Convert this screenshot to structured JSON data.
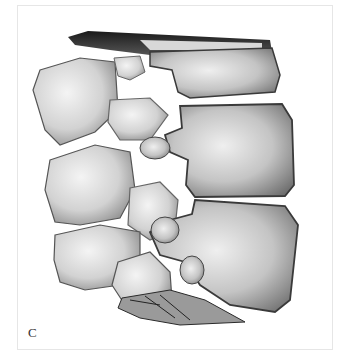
{
  "figure": {
    "panel_label": "C",
    "colors": {
      "background": "#ffffff",
      "frame_border": "#e6e6e6",
      "bone_light": "#ececec",
      "bone_mid": "#b8b8b8",
      "bone_dark": "#3a3a3a",
      "label": "#333333"
    }
  }
}
